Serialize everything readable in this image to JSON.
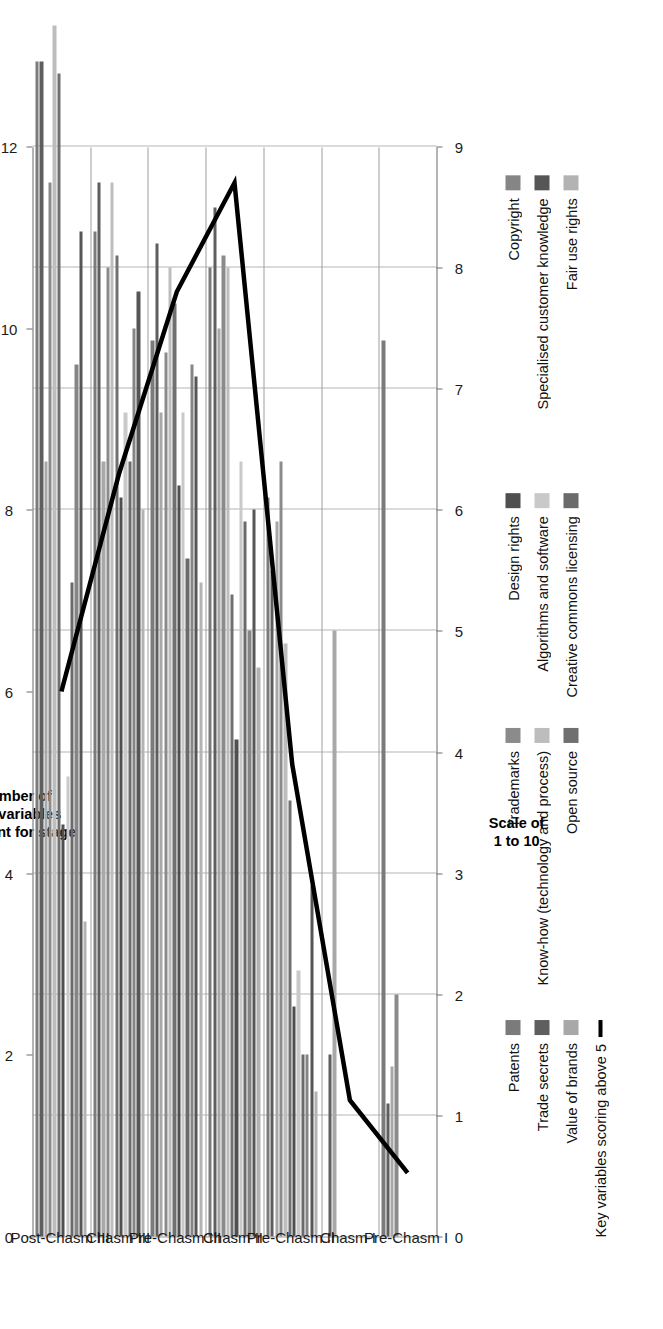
{
  "chart_data": {
    "type": "bar",
    "orientation": "horizontal",
    "title": "",
    "xlabel": "Scale of\n1 to 10",
    "secondary_axis_label": "Number of\nkey variables\nrelevant for stage",
    "primary_axis": {
      "label": "Scale of 1 to 10",
      "min": 0,
      "max": 9,
      "ticks": [
        "0",
        "1",
        "2",
        "3",
        "4",
        "5",
        "6",
        "7",
        "8",
        "9"
      ]
    },
    "secondary_axis": {
      "label": "Number of key variables relevant for stage",
      "min": 0,
      "max": 12,
      "ticks": [
        "0",
        "2",
        "4",
        "6",
        "8",
        "10",
        "12"
      ]
    },
    "grid": true,
    "legend_position": "bottom",
    "categories": [
      "Pre-Chasm I",
      "Chasm I",
      "Pre-Chasm II",
      "Chasm II",
      "Pre-Chasm III",
      "Chasm III",
      "Post-Chasm III"
    ],
    "series": [
      {
        "name": "Patents",
        "color": "#7b7b7b",
        "values": [
          7.4,
          0,
          6.1,
          8.0,
          7.4,
          8.3,
          9.7
        ]
      },
      {
        "name": "Trade secrets",
        "color": "#5e5e5e",
        "values": [
          1.1,
          1.5,
          5.5,
          8.5,
          8.2,
          8.7,
          9.7
        ]
      },
      {
        "name": "Value of brands",
        "color": "#a8a8a8",
        "values": [
          1.4,
          5.0,
          5.9,
          7.5,
          6.8,
          6.4,
          6.4
        ]
      },
      {
        "name": "Trademarks",
        "color": "#8b8b8b",
        "values": [
          2.0,
          0,
          6.4,
          8.1,
          7.3,
          8.0,
          8.7
        ]
      },
      {
        "name": "Know-how (technology and process)",
        "color": "#bdbdbd",
        "values": [
          0,
          0,
          4.9,
          8.0,
          8.0,
          8.7,
          10.0
        ]
      },
      {
        "name": "Open source",
        "color": "#707070",
        "values": [
          0,
          0,
          3.6,
          5.3,
          7.7,
          8.1,
          9.6
        ]
      },
      {
        "name": "Design rights",
        "color": "#4f4f4f",
        "values": [
          0,
          0,
          1.9,
          4.1,
          6.2,
          6.1,
          3.4
        ]
      },
      {
        "name": "Algorithms and software",
        "color": "#c9c9c9",
        "values": [
          0,
          0,
          2.2,
          6.4,
          6.8,
          6.8,
          3.8
        ]
      },
      {
        "name": "Creative commons licensing",
        "color": "#6b6b6b",
        "values": [
          0,
          0,
          1.5,
          5.9,
          5.6,
          6.4,
          5.4
        ]
      },
      {
        "name": "Copyright",
        "color": "#858585",
        "values": [
          0,
          0,
          1.5,
          5.0,
          7.2,
          7.5,
          7.2
        ]
      },
      {
        "name": "Specialised customer knowledge",
        "color": "#565656",
        "values": [
          0,
          0,
          2.9,
          6.0,
          7.1,
          7.8,
          8.3
        ]
      },
      {
        "name": "Fair use rights",
        "color": "#b3b3b3",
        "values": [
          0,
          0,
          1.2,
          4.7,
          5.4,
          6.0,
          2.6
        ]
      }
    ],
    "line_series": {
      "name": "Key variables scoring above 5",
      "color": "#000000",
      "axis": "secondary",
      "values": [
        0.7,
        1.5,
        5.2,
        11.6,
        10.4,
        8.4,
        6.0
      ]
    },
    "legend": [
      "Patents",
      "Trade secrets",
      "Value of brands",
      "Key variables scoring above 5",
      "Trademarks",
      "Know-how (technology and process)",
      "Open source",
      "Design rights",
      "Algorithms and software",
      "Creative commons licensing",
      "Copyright",
      "Specialised customer knowledge",
      "Fair use rights"
    ]
  },
  "axes": {
    "primary_title_line1": "Scale of",
    "primary_title_line2": "1 to 10",
    "secondary_title_line1": "Number of",
    "secondary_title_line2": "key variables",
    "secondary_title_line3": "relevant for stage"
  },
  "legend_columns": [
    {
      "items": [
        {
          "label": "Patents",
          "color": "#7b7b7b",
          "type": "bar"
        },
        {
          "label": "Trade secrets",
          "color": "#5e5e5e",
          "type": "bar"
        },
        {
          "label": "Value of brands",
          "color": "#a8a8a8",
          "type": "bar"
        },
        {
          "label": "Key variables scoring above 5",
          "color": "#000000",
          "type": "line"
        }
      ]
    },
    {
      "items": [
        {
          "label": "Trademarks",
          "color": "#8b8b8b",
          "type": "bar"
        },
        {
          "label": "Know-how (technology and process)",
          "color": "#bdbdbd",
          "type": "bar"
        },
        {
          "label": "Open source",
          "color": "#707070",
          "type": "bar"
        }
      ]
    },
    {
      "items": [
        {
          "label": "Design rights",
          "color": "#4f4f4f",
          "type": "bar"
        },
        {
          "label": "Algorithms and software",
          "color": "#c9c9c9",
          "type": "bar"
        },
        {
          "label": "Creative commons licensing",
          "color": "#6b6b6b",
          "type": "bar"
        }
      ]
    },
    {
      "items": [
        {
          "label": "Copyright",
          "color": "#858585",
          "type": "bar"
        },
        {
          "label": "Specialised customer knowledge",
          "color": "#565656",
          "type": "bar"
        },
        {
          "label": "Fair use rights",
          "color": "#b3b3b3",
          "type": "bar"
        }
      ]
    }
  ]
}
